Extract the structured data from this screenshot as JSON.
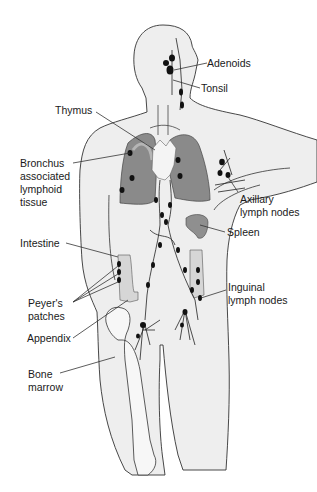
{
  "diagram": {
    "colors": {
      "body_fill": "#eeeeee",
      "outline": "#333333",
      "lung_fill": "#8a8a8a",
      "lung_light": "#b5b5b5",
      "thymus_fill": "#f4f4f4",
      "node_fill": "#111111",
      "intestine_fill": "#d6d6d6",
      "spleen_fill": "#8f8f8f",
      "bone_fill": "#f7f7f7"
    },
    "labels": {
      "adenoids": "Adenoids",
      "tonsil": "Tonsil",
      "thymus": "Thymus",
      "balt": "Bronchus\nassociated\nlymphoid\ntissue",
      "axillary": "Axillary\nlymph nodes",
      "spleen": "Spleen",
      "intestine": "Intestine",
      "inguinal": "Inguinal\nlymph nodes",
      "peyers": "Peyer's\npatches",
      "appendix": "Appendix",
      "bone_marrow": "Bone\nmarrow"
    }
  }
}
